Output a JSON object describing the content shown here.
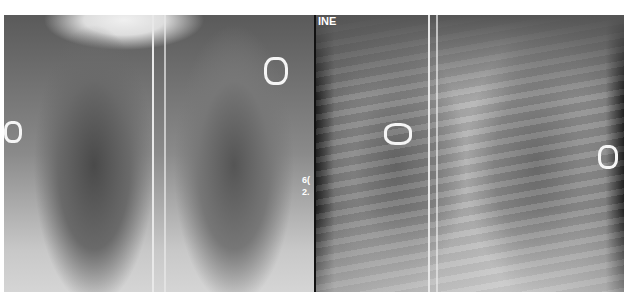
{
  "figure": {
    "panels": [
      {
        "id": "left",
        "description": "chest radiograph, frontal view",
        "overlay_text": []
      },
      {
        "id": "right",
        "description": "chest radiograph, frontal view",
        "overlay_text": [
          "INE"
        ]
      }
    ],
    "margin_text": {
      "line1": "6(",
      "line2": "2."
    }
  }
}
